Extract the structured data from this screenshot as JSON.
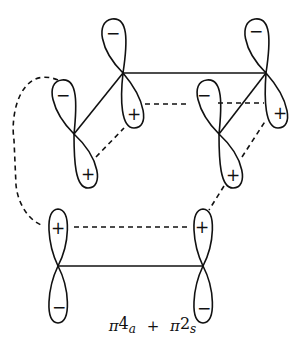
{
  "diagram": {
    "caption": {
      "term1_symbol": "π",
      "term1_electrons": "4",
      "term1_mode": "a",
      "operator": "+",
      "term2_symbol": "π",
      "term2_electrons": "2",
      "term2_mode": "s"
    },
    "signs": {
      "plus": "+",
      "minus": "−"
    },
    "components": [
      {
        "name": "diene (4π, antarafacial)",
        "atoms": [
          "C",
          "A",
          "B",
          "D"
        ]
      },
      {
        "name": "alkene (2π, suprafacial)",
        "atoms": [
          "E",
          "F"
        ]
      }
    ],
    "atoms": {
      "A": {
        "x": 123,
        "y": 73,
        "top_lobe": "−",
        "bottom_lobe": "+"
      },
      "B": {
        "x": 266,
        "y": 73,
        "top_lobe": "−",
        "bottom_lobe": "+"
      },
      "C": {
        "x": 74,
        "y": 134,
        "top_lobe": "−",
        "bottom_lobe": "+"
      },
      "D": {
        "x": 219,
        "y": 134,
        "top_lobe": "−",
        "bottom_lobe": "+"
      },
      "E": {
        "x": 58,
        "y": 266,
        "top_lobe": "+",
        "bottom_lobe": "−"
      },
      "F": {
        "x": 203,
        "y": 266,
        "top_lobe": "+",
        "bottom_lobe": "−"
      }
    },
    "colors": {
      "ink": "#111111",
      "background": "#ffffff"
    }
  }
}
